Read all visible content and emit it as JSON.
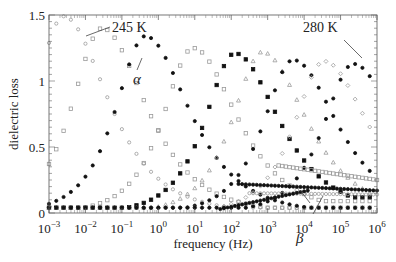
{
  "chart_data": {
    "type": "scatter",
    "title": "",
    "xlabel": "frequency (Hz)",
    "ylabel": "dielectric loss",
    "xscale": "log",
    "xlim_log10": [
      -3,
      6
    ],
    "ylim": [
      0,
      1.5
    ],
    "x_ticks": [
      "10^-3",
      "10^-2",
      "10^-1",
      "10^0",
      "10^1",
      "10^2",
      "10^3",
      "10^4",
      "10^5",
      "10^6"
    ],
    "y_ticks": [
      "0",
      "0.5",
      "1",
      "1.5"
    ],
    "grid": false,
    "legend": "none",
    "annotations": [
      {
        "text": "245 K",
        "points_to_log10f": -1.9,
        "points_to_y": 1.33
      },
      {
        "text": "280 K",
        "points_to_log10f": 5.1,
        "points_to_y": 1.13
      },
      {
        "text": "α",
        "label": "alpha relaxation",
        "points_to_log10f": -0.3,
        "points_to_y": 1.22
      },
      {
        "text": "β",
        "label": "beta relaxation",
        "points_to_log10f": 4.1,
        "points_to_y": 0.17
      }
    ],
    "series": [
      {
        "name": "T1",
        "marker": "open-circle",
        "color": "#9a9a9a",
        "peak_log10f": -2.6,
        "peak_loss": 1.49,
        "beta_level": 0.0
      },
      {
        "name": "T2",
        "marker": "open-square",
        "color": "#9a9a9a",
        "peak_log10f": -1.55,
        "peak_loss": 1.4,
        "beta_level": 0.0
      },
      {
        "name": "245 K",
        "marker": "filled-circle",
        "color": "#111111",
        "peak_log10f": -0.36,
        "peak_loss": 1.34,
        "beta_level": 0.0
      },
      {
        "name": "T4",
        "marker": "open-square",
        "color": "#9a9a9a",
        "peak_log10f": 0.95,
        "peak_loss": 1.25,
        "beta_level": 0.05
      },
      {
        "name": "T5",
        "marker": "filled-square",
        "color": "#111111",
        "peak_log10f": 2.1,
        "peak_loss": 1.21,
        "beta_level": 0.08
      },
      {
        "name": "T6",
        "marker": "open-triangle",
        "color": "#9a9a9a",
        "peak_log10f": 2.85,
        "peak_loss": 1.22,
        "beta_level": 0.1
      },
      {
        "name": "T7",
        "marker": "filled-circle",
        "color": "#111111",
        "peak_log10f": 3.7,
        "peak_loss": 1.16,
        "beta_level": 0.14
      },
      {
        "name": "T8",
        "marker": "open-diamond",
        "color": "#9a9a9a",
        "peak_log10f": 4.55,
        "peak_loss": 1.15,
        "beta_level": 0.17
      },
      {
        "name": "280 K",
        "marker": "filled-circle",
        "color": "#111111",
        "peak_log10f": 5.35,
        "peak_loss": 1.13,
        "beta_level": 0.2
      }
    ],
    "beta_plateaus": [
      {
        "marker": "open-square",
        "from_log10f": 3.3,
        "to_log10f": 6,
        "y_start": 0.36,
        "y_end": 0.25
      },
      {
        "marker": "filled-circle",
        "from_log10f": 2.2,
        "to_log10f": 6,
        "y_start": 0.22,
        "y_end": 0.17
      },
      {
        "marker": "open-circle",
        "from_log10f": 2.5,
        "to_log10f": 6,
        "y_start": 0.15,
        "y_end": 0.14
      },
      {
        "marker": "filled-circle",
        "from_log10f": 1.7,
        "to_log10f": 4.1,
        "y_start": 0.03,
        "y_end": 0.17
      }
    ]
  },
  "labels": {
    "xlabel": "frequency (Hz)",
    "ylabel": "dielectric loss",
    "annot_245": "245 K",
    "annot_280": "280 K",
    "annot_alpha": "α",
    "annot_beta": "β"
  }
}
